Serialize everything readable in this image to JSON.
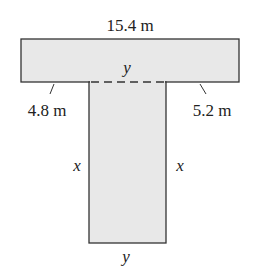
{
  "diagram": {
    "shape": "T-shaped region",
    "fill_color": "#e8e8e8",
    "stroke_color": "#333333",
    "labels": {
      "top_width": "15.4 m",
      "top_inner_y": "y",
      "left_overhang": "4.8 m",
      "right_overhang": "5.2 m",
      "left_side": "x",
      "right_side": "x",
      "bottom_y": "y"
    }
  }
}
